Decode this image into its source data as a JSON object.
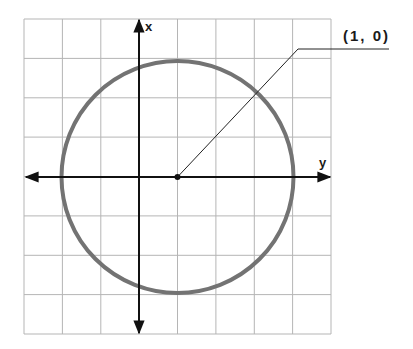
{
  "diagram": {
    "type": "circle-on-grid",
    "axes": {
      "vertical_label": "x",
      "horizontal_label": "y"
    },
    "center_label": "(1, 0)",
    "grid": {
      "columns": 8,
      "rows": 8
    },
    "colors": {
      "grid": "#b5b5b5",
      "axes": "#111111",
      "circle": "#737373",
      "leader": "#222222"
    }
  }
}
